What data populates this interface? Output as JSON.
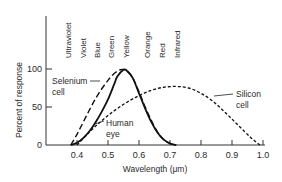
{
  "chart_data": {
    "type": "line",
    "title": "",
    "xlabel": "Wavelength (μm)",
    "ylabel": "Percent of response",
    "xlim": [
      0.3,
      1.0
    ],
    "ylim": [
      0,
      100
    ],
    "x_ticks": [
      0.4,
      0.5,
      0.6,
      0.7,
      0.8,
      0.9,
      1.0
    ],
    "x_tick_labels": [
      "0.4",
      "0.5",
      "0.6",
      "0.7",
      "0.8",
      "0.9",
      "1.0"
    ],
    "y_ticks": [
      0,
      50,
      100
    ],
    "y_tick_labels": [
      "0",
      "50",
      "100"
    ],
    "grid": false,
    "color_bands": [
      {
        "label": "Ultraviolet",
        "x": 0.38
      },
      {
        "label": "Violet",
        "x": 0.42
      },
      {
        "label": "Blue",
        "x": 0.47
      },
      {
        "label": "Green",
        "x": 0.52
      },
      {
        "label": "Yellow",
        "x": 0.58
      },
      {
        "label": "Orange",
        "x": 0.615
      },
      {
        "label": "Red",
        "x": 0.665
      },
      {
        "label": "Infrared",
        "x": 0.715
      }
    ],
    "series": [
      {
        "name": "Selenium cell",
        "style": "long-dash",
        "x": [
          0.38,
          0.4,
          0.42,
          0.44,
          0.46,
          0.48,
          0.5,
          0.52,
          0.54,
          0.56,
          0.58,
          0.6,
          0.62,
          0.64,
          0.66,
          0.68,
          0.7,
          0.72
        ],
        "y": [
          0,
          14,
          30,
          46,
          61,
          74,
          85,
          94,
          99,
          98,
          88,
          70,
          50,
          32,
          17,
          7,
          2,
          0
        ]
      },
      {
        "name": "Human eye",
        "style": "solid",
        "x": [
          0.38,
          0.4,
          0.42,
          0.44,
          0.46,
          0.48,
          0.5,
          0.52,
          0.53,
          0.55,
          0.56,
          0.58,
          0.6,
          0.62,
          0.64,
          0.66,
          0.68,
          0.7,
          0.72
        ],
        "y": [
          0,
          3,
          9,
          18,
          30,
          44,
          60,
          80,
          90,
          99,
          98,
          88,
          68,
          48,
          30,
          16,
          7,
          2,
          0
        ]
      },
      {
        "name": "Silicon cell",
        "style": "short-dash",
        "x": [
          0.4,
          0.44,
          0.48,
          0.52,
          0.56,
          0.6,
          0.64,
          0.68,
          0.72,
          0.76,
          0.8,
          0.84,
          0.88,
          0.92,
          0.96,
          0.99
        ],
        "y": [
          0,
          17,
          32,
          45,
          56,
          65,
          72,
          76,
          77,
          75,
          68,
          57,
          42,
          26,
          10,
          0
        ]
      }
    ],
    "annotations": [
      {
        "label_lines": [
          "Selenium",
          "cell"
        ],
        "points_to": "Selenium cell",
        "at_x": 0.46
      },
      {
        "label_lines": [
          "Human",
          "eye"
        ],
        "points_to": "Human eye",
        "at_x": 0.45
      },
      {
        "label_lines": [
          "Silicon",
          "cell"
        ],
        "points_to": "Silicon cell",
        "at_x": 0.82
      }
    ]
  }
}
